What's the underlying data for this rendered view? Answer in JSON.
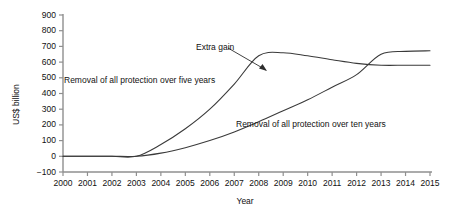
{
  "chart_data": {
    "type": "line",
    "title": "",
    "xlabel": "Year",
    "ylabel": "US$ billion",
    "grid": false,
    "legend_position": "inline-annotations",
    "xlim": [
      2000,
      2015
    ],
    "ylim": [
      -100,
      900
    ],
    "x_ticks": [
      "2000",
      "2001",
      "2002",
      "2003",
      "2004",
      "2005",
      "2006",
      "2007",
      "2008",
      "2009",
      "2010",
      "2011",
      "2012",
      "2013",
      "2014",
      "2015"
    ],
    "y_ticks": [
      "-100",
      "0",
      "100",
      "200",
      "300",
      "400",
      "500",
      "600",
      "700",
      "800",
      "900"
    ],
    "x": [
      2000,
      2001,
      2002,
      2003,
      2004,
      2005,
      2006,
      2007,
      2008,
      2009,
      2010,
      2011,
      2012,
      2013,
      2014,
      2015
    ],
    "series": [
      {
        "name": "Removal of all protection over five years",
        "values": [
          0,
          0,
          0,
          0,
          75,
          175,
          300,
          460,
          640,
          660,
          640,
          615,
          592,
          580,
          580,
          580
        ]
      },
      {
        "name": "Removal of all protection over ten years",
        "values": [
          0,
          0,
          0,
          0,
          20,
          55,
          100,
          155,
          220,
          290,
          360,
          440,
          520,
          650,
          668,
          672
        ]
      }
    ],
    "annotations": [
      {
        "text": "Extra gain",
        "kind": "arrow-label"
      },
      {
        "text": "Removal of all protection over five years",
        "kind": "series-label"
      },
      {
        "text": "Removal of all protection over ten years",
        "kind": "series-label"
      }
    ],
    "colors": {
      "line": "#3a3a3a",
      "axis": "#8a8a8a",
      "background": "#ffffff"
    }
  }
}
